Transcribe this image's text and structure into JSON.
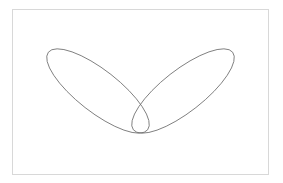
{
  "figure": {
    "stroke_color": "#6e6e6e",
    "frame_color": "#d8d8d8",
    "shapes": [
      {
        "name": "left-ellipse",
        "cx": 98,
        "cy": 91,
        "rx": 63,
        "ry": 21,
        "rotate": 38
      },
      {
        "name": "right-ellipse",
        "cx": 183,
        "cy": 91,
        "rx": 63,
        "ry": 21,
        "rotate": -38
      }
    ]
  }
}
